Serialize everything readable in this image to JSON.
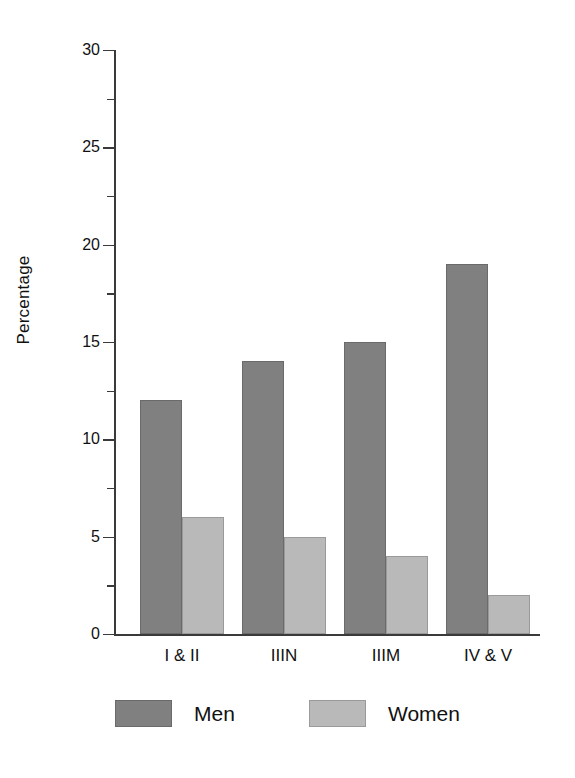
{
  "chart_data": {
    "type": "bar",
    "title": "",
    "subtitle": "",
    "xlabel": "",
    "ylabel": "Percentage",
    "categories": [
      "I & II",
      "IIIN",
      "IIIM",
      "IV & V"
    ],
    "series": [
      {
        "name": "Men",
        "color": "#808080",
        "values": [
          12,
          14,
          15,
          19
        ]
      },
      {
        "name": "Women",
        "color": "#b9b9b9",
        "values": [
          6,
          5,
          4,
          2
        ]
      }
    ],
    "ylim": [
      0,
      30
    ],
    "y_major_ticks": [
      0,
      5,
      10,
      15,
      20,
      25,
      30
    ],
    "y_minor_ticks": [
      2.5,
      7.5,
      12.5,
      17.5,
      22.5,
      27.5
    ],
    "y_tick_labels": [
      "0",
      "5",
      "10",
      "15",
      "20",
      "25",
      "30"
    ],
    "grid": false,
    "legend_position": "bottom",
    "legend_entries": [
      "Men",
      "Women"
    ]
  },
  "axis": {
    "y_title": "Percentage"
  },
  "legend": {
    "items": [
      {
        "label": "Men"
      },
      {
        "label": "Women"
      }
    ]
  }
}
